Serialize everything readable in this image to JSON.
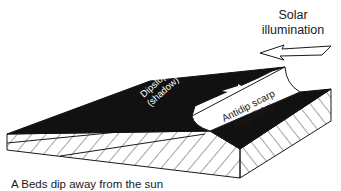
{
  "figure": {
    "legend_label": {
      "line1": "Solar",
      "line2": "illumination"
    },
    "dipslope_label": {
      "line1": "Dipslope",
      "line2": "(shadow)"
    },
    "scarp_label": {
      "line1": "Antidip scarp",
      "line2": "(highlight)"
    },
    "caption": "A  Beds dip away from the sun",
    "colors": {
      "shadow": "#111111",
      "highlight": "#ffffff",
      "line": "#1a1a1a"
    },
    "icons": {
      "sun_direction": "left-arrow-icon",
      "dip_direction": "dip-arrow-icon"
    }
  }
}
